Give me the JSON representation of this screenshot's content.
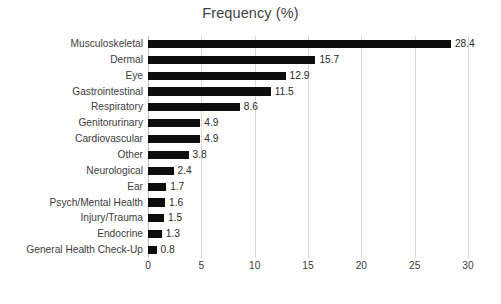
{
  "chart_data": {
    "type": "bar",
    "orientation": "horizontal",
    "title": "Frequency (%)",
    "xlabel": "",
    "ylabel": "",
    "xlim": [
      0,
      30
    ],
    "xticks": [
      0,
      5,
      10,
      15,
      20,
      25,
      30
    ],
    "grid": true,
    "legend": "none",
    "bar_color": "#0d0d0d",
    "gridline_color": "#d9d9d9",
    "background_color": "#ffffff",
    "categories": [
      "Musculoskeletal",
      "Dermal",
      "Eye",
      "Gastrointestinal",
      "Respiratory",
      "Genitorurinary",
      "Cardiovascular",
      "Other",
      "Neurological",
      "Ear",
      "Psych/Mental Health",
      "Injury/Trauma",
      "Endocrine",
      "General Health Check-Up"
    ],
    "values": [
      28.4,
      15.7,
      12.9,
      11.5,
      8.6,
      4.9,
      4.9,
      3.8,
      2.4,
      1.7,
      1.6,
      1.5,
      1.3,
      0.8
    ],
    "data_labels": [
      "28.4",
      "15.7",
      "12.9",
      "11.5",
      "8.6",
      "4.9",
      "4.9",
      "3.8",
      "2.4",
      "1.7",
      "1.6",
      "1.5",
      "1.3",
      "0.8"
    ],
    "tick_labels": [
      "0",
      "5",
      "10",
      "15",
      "20",
      "25",
      "30"
    ]
  }
}
